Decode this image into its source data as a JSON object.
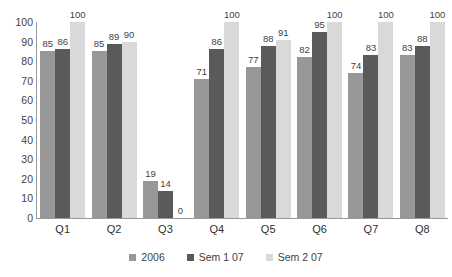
{
  "chart_data": {
    "type": "bar",
    "title": "",
    "subtitle": "",
    "xlabel": "",
    "ylabel": "",
    "ylim": [
      0,
      100
    ],
    "y_ticks": [
      0,
      10,
      20,
      30,
      40,
      50,
      60,
      70,
      80,
      90,
      100
    ],
    "grid": false,
    "legend_position": "bottom",
    "categories": [
      "Q1",
      "Q2",
      "Q3",
      "Q4",
      "Q5",
      "Q6",
      "Q7",
      "Q8"
    ],
    "series": [
      {
        "name": "2006",
        "color": "#989898",
        "values": [
          85,
          85,
          19,
          71,
          77,
          82,
          74,
          83
        ],
        "labels": [
          "85",
          "85",
          "19",
          "71",
          "77",
          "82",
          "74",
          "83"
        ]
      },
      {
        "name": "Sem 1 07",
        "color": "#5a5a5a",
        "values": [
          86,
          89,
          14,
          86,
          88,
          95,
          83,
          88
        ],
        "labels": [
          "86",
          "89",
          "14",
          "86",
          "88",
          "95",
          "83",
          "88"
        ]
      },
      {
        "name": "Sem 2 07",
        "color": "#d9d9d9",
        "values": [
          100,
          90,
          0,
          100,
          91,
          100,
          100,
          100
        ],
        "labels": [
          "100",
          "90",
          "0",
          "100",
          "91",
          "100",
          "100",
          "100"
        ]
      }
    ]
  },
  "axis": {
    "tick_labels": [
      "100",
      "90",
      "80",
      "70",
      "60",
      "50",
      "40",
      "30",
      "20",
      "10",
      "0"
    ]
  },
  "legend": {
    "items": [
      {
        "label": "2006",
        "color": "#989898"
      },
      {
        "label": "Sem 1 07",
        "color": "#5a5a5a"
      },
      {
        "label": "Sem 2 07",
        "color": "#d9d9d9"
      }
    ]
  },
  "colors": {
    "axis": "#9a9a9a",
    "text": "#3f3f3f",
    "background": "#ffffff"
  }
}
